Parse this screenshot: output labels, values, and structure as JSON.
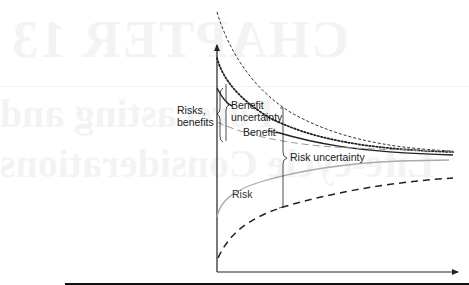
{
  "background_bleed": {
    "chapter": "CHAPTER 13",
    "line1": "Forecasting and",
    "line2": "Life-cycle Considerations"
  },
  "diagram": {
    "y_axis_label": "Risks, benefits",
    "y_axis_label_lines": [
      "Risks,",
      "benefits"
    ],
    "labels": {
      "benefit_uncertainty": [
        "Benefit",
        "uncertainty"
      ],
      "benefit": "Benefit",
      "risk_uncertainty": "Risk uncertainty",
      "risk": "Risk"
    },
    "curves": [
      {
        "name": "benefit-upper-bound",
        "style": "fine-dashed",
        "color": "#333333"
      },
      {
        "name": "benefit-upper-dotted",
        "style": "dotted-heavy",
        "color": "#222222"
      },
      {
        "name": "benefit",
        "style": "solid",
        "color": "#222222"
      },
      {
        "name": "benefit-lower-bound",
        "style": "light-dashed",
        "color": "#888888"
      },
      {
        "name": "risk",
        "style": "solid-grey",
        "color": "#aaaaaa"
      },
      {
        "name": "risk-lower-bound",
        "style": "heavy-dashed",
        "color": "#222222"
      }
    ],
    "colors": {
      "axis": "#222222",
      "page_rule": "#111111"
    }
  }
}
